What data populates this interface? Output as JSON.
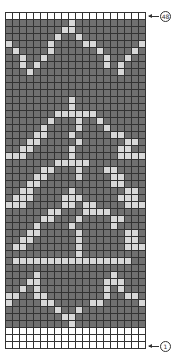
{
  "chart": {
    "columns": 20,
    "rows": 48,
    "colors": {
      "background": "#707070",
      "contrast": "#d8d8d8",
      "blank": "#ffffff"
    },
    "labels": {
      "top_row": "48",
      "bottom_row": "1"
    },
    "legend_codes": {
      "d": "dark main color",
      "l": "light contrast color",
      "w": "white / no stitch"
    },
    "grid": [
      "wwwwwwwwwwwwwwwwwwww",
      "dddddddddlddddddddd",
      "ddddddddlldddddddddd",
      "dddddddlddlddddddddd",
      "ldddddlddddllddddddl",
      "dlddddlddddddlddddld",
      "ddlddlddddddddlddldd",
      "ddldldddddddddldlddd",
      "dddlddddddddddddlddd",
      "dddddddddddddddddddd",
      "dddddddddddddddddddd",
      "dddddddddddddddddddd",
      "dddddddddlddddddddd",
      "dddddddddldddddddddd",
      "dddddddlllllldddddd",
      "ddddddldddlddldddddd",
      "dddddlddddldddlddddd",
      "ddddlldddldddddlldddd",
      "dddlldddddlddddddllddd",
      "ddlldddddlddddddlldd",
      "lllddddddlddddddllll",
      "dddddddlllllddddddd",
      "dddddlldddldddlldddd",
      "ddddllddddlddddllddd",
      "dddllddddddddddlldd",
      "ddlldddddldddddddlldd",
      "dlllddddllldddddllld",
      "llldddddlldllddddlll",
      "ddddddlldddlllldddddd",
      "dddddlldddlddddllddddd",
      "ddddlddddldddddlddddd",
      "dddlldddddlddddddlldd",
      "ddllddddddlddddddlldd",
      "dlldddddddlddddddllld",
      "ddddddddddlddddddddd",
      "dllllllllllllllllldd",
      "dddddddddddddddddddd",
      "ddddlddddddddddlddddd",
      "dddlldddddddddlllddd",
      "ddldldddddddddldldddd",
      "llddllddddddddlddlld",
      "lddddlldddddlldddddl",
      "dddddddlddlddddddddd",
      "ddddddddlldddddddddd",
      "dddddddddldddddddddd",
      "wwwwwwwwwwwwwwwwwwww",
      "wwwwwwwwwwwwwwwwwwww",
      "wwwwwwwwwwwwwwwwwwww"
    ]
  }
}
